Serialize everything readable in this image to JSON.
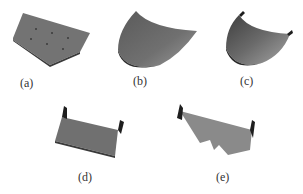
{
  "figure": {
    "panels": [
      {
        "id": "a",
        "label": "(a)",
        "shape": "flat-polygon-plate-with-holes"
      },
      {
        "id": "b",
        "label": "(b)",
        "shape": "curved-surface-sheet"
      },
      {
        "id": "c",
        "label": "(c)",
        "shape": "curved-sheet-with-flanges"
      },
      {
        "id": "d",
        "label": "(d)",
        "shape": "flat-plate-with-two-bent-flanges"
      },
      {
        "id": "e",
        "label": "(e)",
        "shape": "notched-plate-with-two-bent-flanges"
      }
    ],
    "colors": {
      "surface": "#6e6e6e",
      "surface_light": "#8a8a8a",
      "edge_dark": "#2a2a2a",
      "hole": "#3a3a3a"
    }
  }
}
